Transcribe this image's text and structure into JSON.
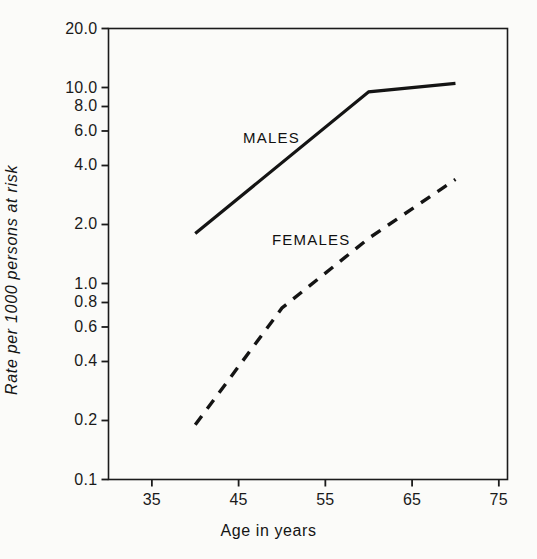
{
  "chart_data": {
    "type": "line",
    "title": "",
    "xlabel": "Age in years",
    "ylabel": "Rate per 1000 persons at risk",
    "yscale": "log",
    "xscale": "linear",
    "xlim": [
      30,
      76
    ],
    "ylim": [
      0.1,
      20.0
    ],
    "grid": false,
    "legend_position": "inline-annotation",
    "x_ticks": [
      35,
      45,
      55,
      65,
      75
    ],
    "x_tick_labels": [
      "35",
      "45",
      "55",
      "65",
      "75"
    ],
    "y_ticks": [
      20.0,
      10.0,
      8.0,
      6.0,
      4.0,
      2.0,
      1.0,
      0.8,
      0.6,
      0.4,
      0.2,
      0.1
    ],
    "y_tick_labels": [
      "20.0",
      "10.0",
      "8.0",
      "6.0",
      "4.0",
      "2.0",
      "1.0",
      "0.8",
      "0.6",
      "0.4",
      "0.2",
      "0.1"
    ],
    "series": [
      {
        "name": "MALES",
        "style": "solid",
        "x": [
          40,
          60,
          70
        ],
        "values": [
          1.8,
          9.5,
          10.5
        ]
      },
      {
        "name": "FEMALES",
        "style": "dashed",
        "x": [
          40,
          50,
          60,
          70
        ],
        "values": [
          0.19,
          0.75,
          1.7,
          3.4
        ]
      }
    ],
    "annotations": [
      {
        "text": "MALES",
        "x": 45.5,
        "y": 5.2
      },
      {
        "text": "FEMALES",
        "x": 49.5,
        "y": 1.85
      }
    ]
  },
  "axes": {
    "x_title": "Age in years",
    "y_title": "Rate per 1000 persons at risk"
  },
  "colors": {
    "ink": "#141414",
    "background": "#fbfbf9"
  }
}
